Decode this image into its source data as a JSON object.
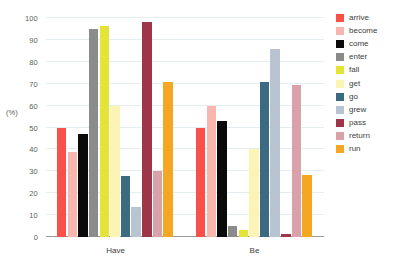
{
  "chart_data": {
    "type": "bar",
    "title": "",
    "subtitle": "",
    "xlabel": "",
    "ylabel": "(%)",
    "ylim": [
      0,
      100
    ],
    "yticks": [
      0,
      10,
      20,
      30,
      40,
      50,
      60,
      70,
      80,
      90,
      100
    ],
    "ytick_labels": [
      "0",
      "10",
      "20",
      "30",
      "40",
      "50",
      "60",
      "70",
      "80",
      "90",
      "100"
    ],
    "categories": [
      "Have",
      "Be"
    ],
    "grid": true,
    "grid_axis": "y",
    "legend_position": "right",
    "series": [
      {
        "name": "arrive",
        "color": "#f9514a",
        "values": [
          50,
          50
        ]
      },
      {
        "name": "become",
        "color": "#f9b6ae",
        "values": [
          39,
          60
        ]
      },
      {
        "name": "come",
        "color": "#0a0a0a",
        "values": [
          47,
          53
        ]
      },
      {
        "name": "enter",
        "color": "#8b8b8b",
        "values": [
          95,
          5
        ]
      },
      {
        "name": "fall",
        "color": "#e3e338",
        "values": [
          96.5,
          3
        ]
      },
      {
        "name": "get",
        "color": "#fbf4b4",
        "values": [
          60,
          40
        ]
      },
      {
        "name": "go",
        "color": "#3b6b80",
        "values": [
          28,
          71
        ]
      },
      {
        "name": "grew",
        "color": "#b8c4d2",
        "values": [
          13.5,
          86
        ]
      },
      {
        "name": "pass",
        "color": "#9e3549",
        "values": [
          98,
          1.5
        ]
      },
      {
        "name": "return",
        "color": "#d9a2ab",
        "values": [
          30,
          69.5
        ]
      },
      {
        "name": "run",
        "color": "#f5a623",
        "values": [
          71,
          28.5
        ]
      }
    ]
  },
  "legend": {
    "items": [
      {
        "label": "arrive",
        "color": "#f9514a"
      },
      {
        "label": "become",
        "color": "#f9b6ae"
      },
      {
        "label": "come",
        "color": "#0a0a0a"
      },
      {
        "label": "enter",
        "color": "#8b8b8b"
      },
      {
        "label": "fall",
        "color": "#e3e338"
      },
      {
        "label": "get",
        "color": "#fbf4b4"
      },
      {
        "label": "go",
        "color": "#3b6b80"
      },
      {
        "label": "grew",
        "color": "#b8c4d2"
      },
      {
        "label": "pass",
        "color": "#9e3549"
      },
      {
        "label": "return",
        "color": "#d9a2ab"
      },
      {
        "label": "run",
        "color": "#f5a623"
      }
    ]
  },
  "colors": {
    "background": "#ffffff",
    "gridline": "#e3eef0",
    "axis": "#9a9a9a",
    "text": "#3d3d3d",
    "tick_text": "#5c5c5c"
  }
}
